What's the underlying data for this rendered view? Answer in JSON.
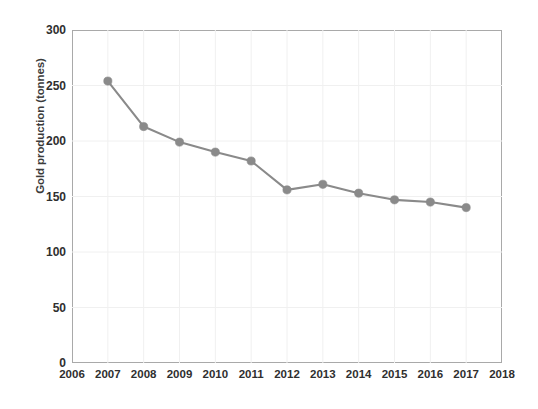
{
  "chart_data": {
    "type": "line",
    "title": "",
    "subtitle": "",
    "xlabel": "",
    "ylabel": "Gold production (tonnes)",
    "x": [
      2007,
      2008,
      2009,
      2010,
      2011,
      2012,
      2013,
      2014,
      2015,
      2016,
      2017
    ],
    "values": [
      254,
      213,
      199,
      190,
      182,
      156,
      161,
      153,
      147,
      145,
      140
    ],
    "series": [
      {
        "name": "Gold production",
        "x": [
          2007,
          2008,
          2009,
          2010,
          2011,
          2012,
          2013,
          2014,
          2015,
          2016,
          2017
        ],
        "values": [
          254,
          213,
          199,
          190,
          182,
          156,
          161,
          153,
          147,
          145,
          140
        ],
        "color": "#8a8a8a",
        "marker": "circle"
      }
    ],
    "xlim": [
      2006,
      2018
    ],
    "ylim": [
      0,
      300
    ],
    "x_ticks": [
      2006,
      2007,
      2008,
      2009,
      2010,
      2011,
      2012,
      2013,
      2014,
      2015,
      2016,
      2017,
      2018
    ],
    "x_tick_labels": [
      "2006",
      "2007",
      "2008",
      "2009",
      "2010",
      "2011",
      "2012",
      "2013",
      "2014",
      "2015",
      "2016",
      "2017",
      "2018"
    ],
    "y_ticks": [
      0,
      50,
      100,
      150,
      200,
      250,
      300
    ],
    "y_tick_labels": [
      "0",
      "50",
      "100",
      "150",
      "200",
      "250",
      "300"
    ],
    "grid": true,
    "grid_color": "#f0f0f0",
    "legend": false,
    "legend_position": "none",
    "axis_color": "#a9a9a9",
    "background": "#ffffff",
    "annotations": []
  }
}
